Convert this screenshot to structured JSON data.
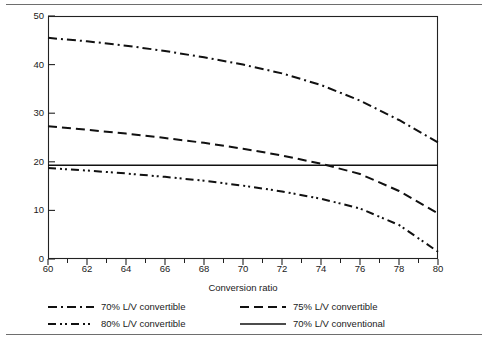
{
  "chart_data": {
    "type": "line",
    "title": "",
    "xlabel": "Conversion ratio",
    "ylabel": "AT/RR on equity with growth at 3 percent",
    "xlim": [
      60,
      80
    ],
    "ylim": [
      0,
      50
    ],
    "grid": false,
    "legend_position": "below-plot",
    "x_ticks_major": [
      60,
      62,
      64,
      66,
      68,
      70,
      72,
      74,
      76,
      78,
      80
    ],
    "x_ticks_minor": [
      61,
      63,
      65,
      67,
      69,
      71,
      73,
      75,
      77,
      79
    ],
    "y_ticks_major": [
      0,
      10,
      20,
      30,
      40,
      50
    ],
    "x": [
      60,
      62,
      64,
      66,
      68,
      70,
      72,
      74,
      76,
      78,
      80
    ],
    "series": [
      {
        "name": "70% L/V convertible",
        "style": "dash-dot",
        "color": "#111111",
        "values": [
          45.5,
          44.8,
          43.9,
          42.8,
          41.5,
          40.0,
          38.2,
          35.8,
          32.6,
          28.6,
          24.0
        ]
      },
      {
        "name": "75% L/V convertible",
        "style": "dashed",
        "color": "#111111",
        "values": [
          27.3,
          26.6,
          25.8,
          24.9,
          23.9,
          22.7,
          21.3,
          19.6,
          17.5,
          14.0,
          9.4
        ]
      },
      {
        "name": "80% L/V convertible",
        "style": "dash-dot-dot",
        "color": "#111111",
        "values": [
          18.7,
          18.2,
          17.6,
          16.9,
          16.1,
          15.1,
          13.9,
          12.4,
          10.4,
          7.0,
          1.5
        ]
      },
      {
        "name": "70% L/V conventional",
        "style": "solid",
        "color": "#111111",
        "values": [
          19.3,
          19.3,
          19.3,
          19.3,
          19.3,
          19.3,
          19.3,
          19.3,
          19.3,
          19.3,
          19.3
        ]
      }
    ]
  },
  "legend": {
    "rows": [
      [
        {
          "label": "70% L/V convertible",
          "style": "dash-dot"
        },
        {
          "label": "75% L/V convertible",
          "style": "dashed"
        }
      ],
      [
        {
          "label": "80% L/V convertible",
          "style": "dash-dot-dot"
        },
        {
          "label": "70% L/V conventional",
          "style": "solid"
        }
      ]
    ]
  }
}
